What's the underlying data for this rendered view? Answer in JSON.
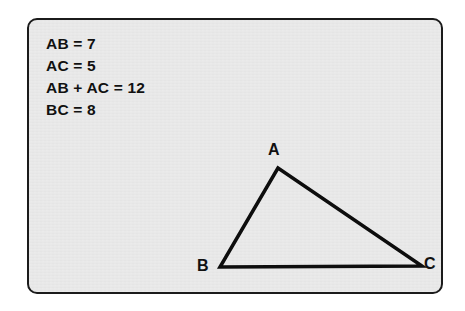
{
  "figure": {
    "name": "triangle-with-given-lengths",
    "panel": {
      "fill_color": "#e7e7e7",
      "border_color": "#1b1b1b",
      "background_color": "#ffffff"
    },
    "givens": [
      {
        "id": "ab",
        "text": "AB = 7"
      },
      {
        "id": "ac",
        "text": "AC = 5"
      },
      {
        "id": "ab-plus-ac",
        "text": "AB + AC = 12"
      },
      {
        "id": "bc",
        "text": "BC = 8"
      }
    ],
    "triangle": {
      "stroke_color": "#0d0d0d",
      "stroke_width": 3.5,
      "vertices": [
        {
          "label": "A",
          "x": 249,
          "y": 148
        },
        {
          "label": "B",
          "x": 191,
          "y": 247
        },
        {
          "label": "C",
          "x": 393,
          "y": 246
        }
      ],
      "vertex_labels": {
        "a": "A",
        "b": "B",
        "c": "C"
      },
      "sides": [
        {
          "name": "AB",
          "from": "A",
          "to": "B",
          "length": 7
        },
        {
          "name": "AC",
          "from": "A",
          "to": "C",
          "length": 5
        },
        {
          "name": "BC",
          "from": "B",
          "to": "C",
          "length": 8
        }
      ]
    }
  },
  "chart_data": {
    "type": "diagram",
    "title": "",
    "subtitle": "",
    "annotations": [
      "AB = 7",
      "AC = 5",
      "AB + AC = 12",
      "BC = 8"
    ],
    "points": [
      {
        "name": "A",
        "x": 249,
        "y": 148
      },
      {
        "name": "B",
        "x": 191,
        "y": 247
      },
      {
        "name": "C",
        "x": 393,
        "y": 246
      }
    ],
    "edges": [
      {
        "from": "A",
        "to": "B",
        "label": "AB",
        "value": 7
      },
      {
        "from": "A",
        "to": "C",
        "label": "AC",
        "value": 5
      },
      {
        "from": "B",
        "to": "C",
        "label": "BC",
        "value": 8
      }
    ],
    "legend": [],
    "grid": false
  }
}
